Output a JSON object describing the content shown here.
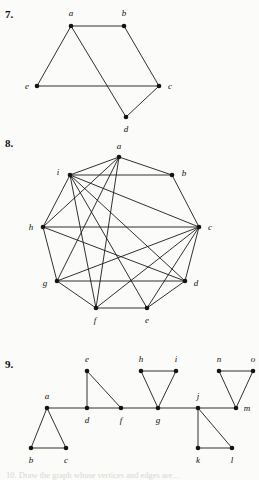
{
  "page": {
    "width": 259,
    "height": 478,
    "background": "#fbfbf9",
    "ink": "#141414"
  },
  "problems": [
    {
      "number": "7.",
      "number_pos": [
        5,
        8
      ],
      "graph": {
        "vertices": [
          {
            "id": "a",
            "label": "a",
            "x": 71,
            "y": 26,
            "label_x": 71,
            "label_y": 13
          },
          {
            "id": "b",
            "label": "b",
            "x": 124,
            "y": 26,
            "label_x": 124,
            "label_y": 13
          },
          {
            "id": "c",
            "label": "c",
            "x": 159,
            "y": 86,
            "label_x": 170,
            "label_y": 86
          },
          {
            "id": "d",
            "label": "d",
            "x": 126,
            "y": 117,
            "label_x": 126,
            "label_y": 129
          },
          {
            "id": "e",
            "label": "e",
            "x": 37,
            "y": 86,
            "label_x": 27,
            "label_y": 86
          }
        ],
        "edges": [
          [
            "a",
            "b"
          ],
          [
            "a",
            "e"
          ],
          [
            "a",
            "d"
          ],
          [
            "b",
            "c"
          ],
          [
            "e",
            "c"
          ],
          [
            "c",
            "d"
          ]
        ]
      }
    },
    {
      "number": "8.",
      "number_pos": [
        5,
        137
      ],
      "graph": {
        "vertices": [
          {
            "id": "a",
            "label": "a",
            "x": 119,
            "y": 157,
            "label_x": 119,
            "label_y": 146
          },
          {
            "id": "b",
            "label": "b",
            "x": 172,
            "y": 175,
            "label_x": 184,
            "label_y": 173
          },
          {
            "id": "c",
            "label": "c",
            "x": 199,
            "y": 227,
            "label_x": 210,
            "label_y": 227
          },
          {
            "id": "d",
            "label": "d",
            "x": 185,
            "y": 281,
            "label_x": 196,
            "label_y": 283
          },
          {
            "id": "e",
            "label": "e",
            "x": 147,
            "y": 308,
            "label_x": 147,
            "label_y": 320
          },
          {
            "id": "f",
            "label": "f",
            "x": 96,
            "y": 308,
            "label_x": 95,
            "label_y": 320
          },
          {
            "id": "g",
            "label": "g",
            "x": 57,
            "y": 281,
            "label_x": 45,
            "label_y": 283
          },
          {
            "id": "h",
            "label": "h",
            "x": 43,
            "y": 227,
            "label_x": 31,
            "label_y": 227
          },
          {
            "id": "i",
            "label": "i",
            "x": 70,
            "y": 175,
            "label_x": 58,
            "label_y": 172
          }
        ],
        "edges": [
          [
            "a",
            "b"
          ],
          [
            "b",
            "c"
          ],
          [
            "c",
            "d"
          ],
          [
            "d",
            "e"
          ],
          [
            "e",
            "f"
          ],
          [
            "f",
            "g"
          ],
          [
            "g",
            "h"
          ],
          [
            "h",
            "i"
          ],
          [
            "i",
            "a"
          ],
          [
            "a",
            "i"
          ],
          [
            "a",
            "h"
          ],
          [
            "a",
            "g"
          ],
          [
            "a",
            "f"
          ],
          [
            "i",
            "b"
          ],
          [
            "i",
            "c"
          ],
          [
            "i",
            "d"
          ],
          [
            "i",
            "e"
          ],
          [
            "i",
            "f"
          ],
          [
            "i",
            "h"
          ],
          [
            "h",
            "c"
          ],
          [
            "h",
            "d"
          ],
          [
            "c",
            "g"
          ],
          [
            "c",
            "f"
          ],
          [
            "c",
            "e"
          ],
          [
            "g",
            "d"
          ]
        ]
      }
    },
    {
      "number": "9.",
      "number_pos": [
        5,
        358
      ],
      "graph": {
        "vertices": [
          {
            "id": "a",
            "label": "a",
            "x": 47,
            "y": 408,
            "label_x": 47,
            "label_y": 396
          },
          {
            "id": "b",
            "label": "b",
            "x": 31,
            "y": 448,
            "label_x": 31,
            "label_y": 460
          },
          {
            "id": "c",
            "label": "c",
            "x": 66,
            "y": 448,
            "label_x": 66,
            "label_y": 460
          },
          {
            "id": "d",
            "label": "d",
            "x": 87,
            "y": 408,
            "label_x": 87,
            "label_y": 420
          },
          {
            "id": "e",
            "label": "e",
            "x": 87,
            "y": 371,
            "label_x": 87,
            "label_y": 359
          },
          {
            "id": "f",
            "label": "f",
            "x": 121,
            "y": 408,
            "label_x": 121,
            "label_y": 420
          },
          {
            "id": "g",
            "label": "g",
            "x": 158,
            "y": 408,
            "label_x": 158,
            "label_y": 420
          },
          {
            "id": "h",
            "label": "h",
            "x": 141,
            "y": 371,
            "label_x": 141,
            "label_y": 359
          },
          {
            "id": "i",
            "label": "i",
            "x": 176,
            "y": 371,
            "label_x": 176,
            "label_y": 359
          },
          {
            "id": "j",
            "label": "j",
            "x": 198,
            "y": 408,
            "label_x": 198,
            "label_y": 396
          },
          {
            "id": "k",
            "label": "k",
            "x": 198,
            "y": 448,
            "label_x": 198,
            "label_y": 460
          },
          {
            "id": "l",
            "label": "l",
            "x": 232,
            "y": 448,
            "label_x": 232,
            "label_y": 460
          },
          {
            "id": "m",
            "label": "m",
            "x": 236,
            "y": 408,
            "label_x": 247,
            "label_y": 408
          },
          {
            "id": "n",
            "label": "n",
            "x": 219,
            "y": 371,
            "label_x": 219,
            "label_y": 359
          },
          {
            "id": "o",
            "label": "o",
            "x": 253,
            "y": 371,
            "label_x": 253,
            "label_y": 359
          }
        ],
        "edges": [
          [
            "a",
            "b"
          ],
          [
            "a",
            "c"
          ],
          [
            "b",
            "c"
          ],
          [
            "a",
            "d"
          ],
          [
            "d",
            "e"
          ],
          [
            "d",
            "f"
          ],
          [
            "e",
            "f"
          ],
          [
            "f",
            "g"
          ],
          [
            "g",
            "h"
          ],
          [
            "g",
            "i"
          ],
          [
            "h",
            "i"
          ],
          [
            "g",
            "j"
          ],
          [
            "j",
            "k"
          ],
          [
            "j",
            "l"
          ],
          [
            "k",
            "l"
          ],
          [
            "j",
            "m"
          ],
          [
            "m",
            "n"
          ],
          [
            "m",
            "o"
          ],
          [
            "n",
            "o"
          ]
        ]
      }
    }
  ],
  "artifacts": {
    "bottom_cut_text": "10. Draw the graph whose vertices and edges are..."
  }
}
